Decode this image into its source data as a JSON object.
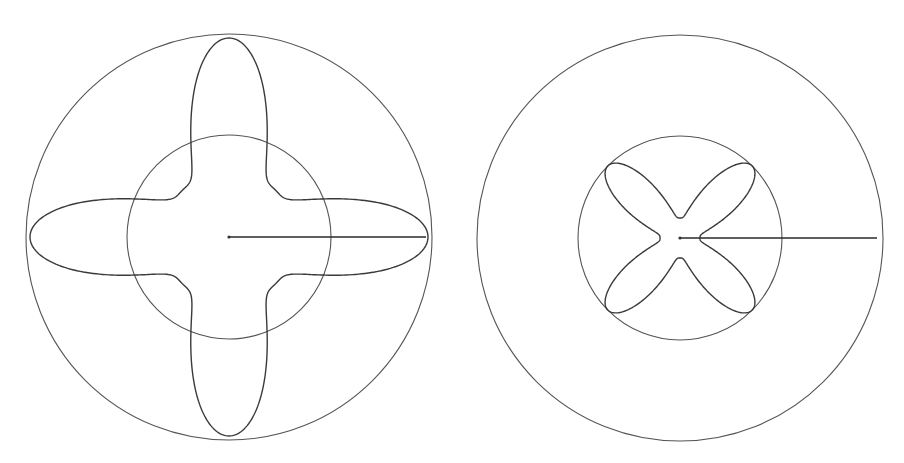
{
  "diagram": {
    "stroke_color": "#3a3a3a",
    "background": "#ffffff",
    "figures": [
      {
        "name": "left-figure",
        "center": [
          229,
          237
        ],
        "outer_radius": 203,
        "inner_radius": 102,
        "radius_line_end": [
          426,
          237
        ],
        "curve": {
          "shape": "four-petal-cross",
          "orientation_deg": 0,
          "min_r": 66,
          "max_r": 199,
          "exponent": 4
        }
      },
      {
        "name": "right-figure",
        "center": [
          680,
          238
        ],
        "outer_radius": 203,
        "inner_radius": 102,
        "radius_line_end": [
          877,
          238
        ],
        "curve": {
          "shape": "four-petal-x",
          "orientation_deg": 45,
          "min_r": 20,
          "max_r": 102,
          "exponent": 3.5
        }
      }
    ]
  }
}
